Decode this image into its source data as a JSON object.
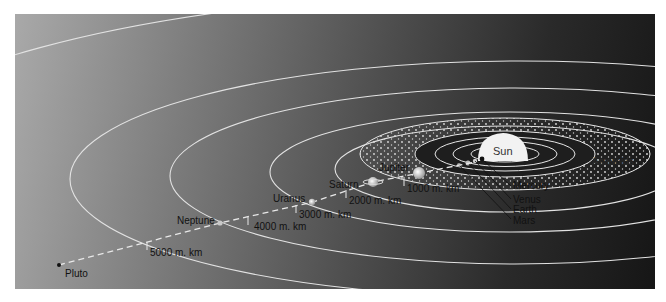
{
  "diagram": {
    "title": "",
    "type": "solar-system-orbit-diagram",
    "bodies": [
      {
        "name": "Sun",
        "label": "Sun"
      },
      {
        "name": "Mercury",
        "label": "Mercury"
      },
      {
        "name": "Venus",
        "label": "Venus"
      },
      {
        "name": "Earth",
        "label": "Earth"
      },
      {
        "name": "Mars",
        "label": "Mars"
      },
      {
        "name": "Asteroids",
        "label": "Asteroids"
      },
      {
        "name": "Jupiter",
        "label": "Jupiter"
      },
      {
        "name": "Saturn",
        "label": "Saturn"
      },
      {
        "name": "Uranus",
        "label": "Uranus"
      },
      {
        "name": "Neptune",
        "label": "Neptune"
      },
      {
        "name": "Pluto",
        "label": "Pluto"
      }
    ],
    "distance_markers": [
      {
        "label": "1000 m. km"
      },
      {
        "label": "2000 m. km"
      },
      {
        "label": "3000 m. km"
      },
      {
        "label": "4000 m. km"
      },
      {
        "label": "5000 m. km"
      }
    ],
    "colors": {
      "orbit": "#e6e6e6",
      "background_light": "#a9a9a9",
      "background_dark": "#161616",
      "sun": "#f2f2f2",
      "label_text": "#111111"
    }
  }
}
